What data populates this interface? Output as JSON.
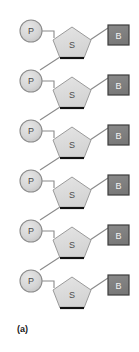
{
  "figure": {
    "caption": "(a)",
    "type": "nucleic-acid-backbone-schematic",
    "width": 139,
    "height": 352
  },
  "colors": {
    "background": "#ffffff",
    "phosphate_fill": "#d2d2d2",
    "phosphate_stroke": "#8c8c8c",
    "phosphate_text": "#4a4a4a",
    "sugar_fill": "#dcdcdc",
    "sugar_stroke": "#9a9a9a",
    "sugar_text": "#4d4d4d",
    "sugar_base_edge": "#111111",
    "base_fill": "#808080",
    "base_stroke": "#3d3d3d",
    "base_text": "#f2f2f2",
    "connector": "#8a8a8a",
    "caption_text": "#1a1a1a"
  },
  "legend": {
    "phosphate_label": "P",
    "sugar_label": "S",
    "base_label": "B"
  },
  "units": [
    {
      "index": 1,
      "phosphate": {
        "label": "P",
        "cx": 31,
        "cy": 31,
        "r": 11
      },
      "sugar": {
        "label": "S",
        "cx": 72,
        "cy": 43
      },
      "base": {
        "label": "B",
        "x": 108,
        "y": 25,
        "w": 21,
        "h": 20
      },
      "has_next_link": true
    },
    {
      "index": 2,
      "phosphate": {
        "label": "P",
        "cx": 31,
        "cy": 81,
        "r": 11
      },
      "sugar": {
        "label": "S",
        "cx": 72,
        "cy": 93
      },
      "base": {
        "label": "B",
        "x": 108,
        "y": 75,
        "w": 21,
        "h": 20
      },
      "has_next_link": true
    },
    {
      "index": 3,
      "phosphate": {
        "label": "P",
        "cx": 31,
        "cy": 131,
        "r": 11
      },
      "sugar": {
        "label": "S",
        "cx": 72,
        "cy": 143
      },
      "base": {
        "label": "B",
        "x": 108,
        "y": 125,
        "w": 21,
        "h": 20
      },
      "has_next_link": true
    },
    {
      "index": 4,
      "phosphate": {
        "label": "P",
        "cx": 31,
        "cy": 181,
        "r": 11
      },
      "sugar": {
        "label": "S",
        "cx": 72,
        "cy": 193
      },
      "base": {
        "label": "B",
        "x": 108,
        "y": 175,
        "w": 21,
        "h": 20
      },
      "has_next_link": true
    },
    {
      "index": 5,
      "phosphate": {
        "label": "P",
        "cx": 31,
        "cy": 231,
        "r": 11
      },
      "sugar": {
        "label": "S",
        "cx": 72,
        "cy": 243
      },
      "base": {
        "label": "B",
        "x": 108,
        "y": 225,
        "w": 21,
        "h": 20
      },
      "has_next_link": true
    },
    {
      "index": 6,
      "phosphate": {
        "label": "P",
        "cx": 31,
        "cy": 281,
        "r": 11
      },
      "sugar": {
        "label": "S",
        "cx": 72,
        "cy": 293
      },
      "base": {
        "label": "B",
        "x": 108,
        "y": 275,
        "w": 21,
        "h": 20
      },
      "has_next_link": false
    }
  ]
}
